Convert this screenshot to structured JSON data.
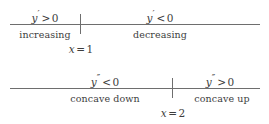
{
  "figure": {
    "background_color": "#ffffff",
    "line_color": "#6e6e6e",
    "text_color": "#3d3d3d"
  },
  "first_derivative_line": {
    "variable": "y",
    "prime": "′",
    "critical_point": {
      "variable": "x",
      "operator": "=",
      "value": "1",
      "full": "x = 1"
    },
    "left": {
      "sign_variable": "y",
      "prime": "′",
      "operator": ">",
      "value": "0",
      "full": "y′ > 0",
      "behavior": "increasing"
    },
    "right": {
      "sign_variable": "y",
      "prime": "′",
      "operator": "<",
      "value": "0",
      "full": "y′ < 0",
      "behavior": "decreasing"
    }
  },
  "second_derivative_line": {
    "variable": "y",
    "prime": "″",
    "critical_point": {
      "variable": "x",
      "operator": "=",
      "value": "2",
      "full": "x = 2"
    },
    "left": {
      "sign_variable": "y",
      "prime": "″",
      "operator": "<",
      "value": "0",
      "full": "y″ < 0",
      "behavior": "concave down"
    },
    "right": {
      "sign_variable": "y",
      "prime": "″",
      "operator": ">",
      "value": "0",
      "full": "y″ > 0",
      "behavior": "concave up"
    }
  }
}
